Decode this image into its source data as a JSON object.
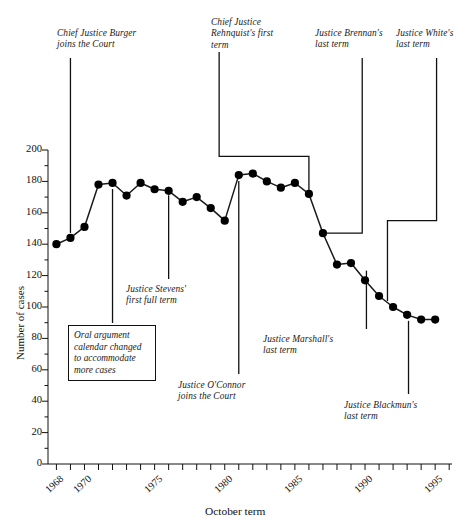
{
  "chart_data": {
    "type": "line",
    "title": "",
    "xlabel": "October term",
    "ylabel": "Number of cases",
    "ylim": [
      0,
      200
    ],
    "xlim": [
      1967.4,
      1996.2
    ],
    "ytick_labels": [
      "200",
      "180",
      "160",
      "140",
      "120",
      "100",
      "80",
      "60",
      "40",
      "20",
      "0"
    ],
    "ytick_values": [
      200,
      180,
      160,
      140,
      120,
      100,
      80,
      60,
      40,
      20,
      0
    ],
    "xtick_labels": [
      "1968",
      "1970",
      "1975",
      "1980",
      "1985",
      "1990",
      "1995"
    ],
    "xtick_values": [
      1968,
      1970,
      1975,
      1980,
      1985,
      1990,
      1995
    ],
    "grid": false,
    "legend": "none",
    "marker": "filled-circle",
    "x": [
      1968,
      1969,
      1970,
      1971,
      1972,
      1973,
      1974,
      1975,
      1976,
      1977,
      1978,
      1979,
      1980,
      1981,
      1982,
      1983,
      1984,
      1985,
      1986,
      1987,
      1988,
      1989,
      1990,
      1991,
      1992,
      1993,
      1994,
      1995
    ],
    "values": [
      140,
      144,
      151,
      178,
      179,
      171,
      179,
      175,
      174,
      167,
      170,
      163,
      155,
      184,
      185,
      180,
      176,
      179,
      172,
      147,
      127,
      128,
      117,
      107,
      100,
      95,
      92,
      92
    ],
    "series": [
      {
        "name": "Number of cases",
        "values": [
          140,
          144,
          151,
          178,
          179,
          171,
          179,
          175,
          174,
          167,
          170,
          163,
          155,
          184,
          185,
          180,
          176,
          179,
          172,
          147,
          127,
          128,
          117,
          107,
          100,
          95,
          92,
          92
        ]
      }
    ],
    "annotations": [
      {
        "id": "burger",
        "text": "Chief Justice Burger\njoins the Court",
        "term": 1969
      },
      {
        "id": "stevens",
        "text": "Justice Stevens'\nfirst full term",
        "term": 1976
      },
      {
        "id": "oral-argument",
        "text": "Oral argument\ncalendar changed\nto accommodate\nmore cases",
        "term": 1972
      },
      {
        "id": "oconnor",
        "text": "Justice O'Connor\njoins the Court",
        "term": 1981
      },
      {
        "id": "rehnquist",
        "text": "Chief Justice\nRehnquist's first\nterm",
        "term": 1986
      },
      {
        "id": "marshall",
        "text": "Justice Marshall's\nlast term",
        "term": 1990
      },
      {
        "id": "brennan",
        "text": "Justice Brennan's\nlast term",
        "term": 1989
      },
      {
        "id": "blackmun",
        "text": "Justice Blackmun's\nlast term",
        "term": 1993
      },
      {
        "id": "white",
        "text": "Justice White's\nlast term",
        "term": 1992
      }
    ]
  },
  "axes": {
    "y_title": "Number of cases",
    "x_title": "October term",
    "y_ticks": [
      {
        "label": "200"
      },
      {
        "label": "180"
      },
      {
        "label": "160"
      },
      {
        "label": "140"
      },
      {
        "label": "120"
      },
      {
        "label": "100"
      },
      {
        "label": "80"
      },
      {
        "label": "60"
      },
      {
        "label": "40"
      },
      {
        "label": "20"
      },
      {
        "label": "0"
      }
    ],
    "x_ticks": [
      {
        "label": "1968"
      },
      {
        "label": "1970"
      },
      {
        "label": "1975"
      },
      {
        "label": "1980"
      },
      {
        "label": "1985"
      },
      {
        "label": "1990"
      },
      {
        "label": "1995"
      }
    ]
  },
  "annotations": {
    "burger": "Chief Justice Burger\njoins the Court",
    "stevens": "Justice Stevens'\nfirst full term",
    "oral_argument": "Oral argument\ncalendar changed\nto accommodate\nmore cases",
    "oconnor": "Justice O'Connor\njoins the Court",
    "rehnquist": "Chief Justice\nRehnquist's first\nterm",
    "marshall": "Justice Marshall's\nlast term",
    "brennan": "Justice Brennan's\nlast term",
    "blackmun": "Justice Blackmun's\nlast term",
    "white": "Justice White's\nlast term"
  },
  "colors": {
    "ink": "#111111",
    "line": "#1a1a1a",
    "marker": "#000000",
    "background": "#ffffff"
  }
}
